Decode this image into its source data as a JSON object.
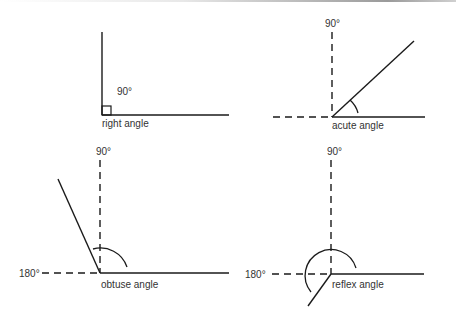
{
  "diagram": {
    "panels": [
      {
        "id": "right",
        "caption": "right angle",
        "angle_label": "90°",
        "degrees": 90
      },
      {
        "id": "acute",
        "caption": "acute angle",
        "reference_label": "90°",
        "degrees": 40
      },
      {
        "id": "obtuse",
        "caption": "obtuse angle",
        "reference_label_top": "90°",
        "reference_label_left": "180°",
        "degrees": 115
      },
      {
        "id": "reflex",
        "caption": "reflex angle",
        "reference_label_top": "90°",
        "reference_label_left": "180°",
        "degrees": 235
      }
    ]
  },
  "colors": {
    "line": "#1a1a1a",
    "text": "#333333",
    "background": "#ffffff"
  }
}
